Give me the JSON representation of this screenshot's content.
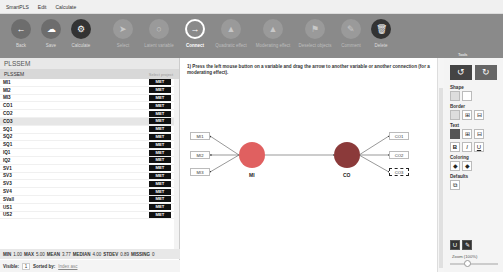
{
  "menubar": {
    "items": [
      "SmartPLS",
      "Edit",
      "Calculate"
    ]
  },
  "toolbar": {
    "buttons": [
      {
        "label": "Back",
        "icon": "←",
        "state": "normal"
      },
      {
        "label": "Save",
        "icon": "☁",
        "state": "normal"
      },
      {
        "label": "Calculate",
        "icon": "⚙",
        "state": "normal"
      },
      {
        "label": "Select",
        "icon": "➤",
        "state": "disabled"
      },
      {
        "label": "Latent variable",
        "icon": "○",
        "state": "disabled"
      },
      {
        "label": "Connect",
        "icon": "→",
        "state": "active"
      },
      {
        "label": "Quadratic effect",
        "icon": "▲",
        "state": "disabled"
      },
      {
        "label": "Moderating effect",
        "icon": "▲",
        "state": "disabled"
      },
      {
        "label": "Deselect objects",
        "icon": "⚑",
        "state": "disabled"
      },
      {
        "label": "Comment",
        "icon": "✎",
        "state": "disabled"
      },
      {
        "label": "Delete",
        "icon": "🗑",
        "state": "normal"
      }
    ],
    "tools_label": "Tools"
  },
  "left_panel": {
    "title": "PLSSEM",
    "project": "PLSSEM",
    "select_label": "Select project",
    "rows": [
      {
        "name": "MI1",
        "badge": "MET"
      },
      {
        "name": "MI2",
        "badge": "MET"
      },
      {
        "name": "MI3",
        "badge": "MET"
      },
      {
        "name": "CO1",
        "badge": "MET"
      },
      {
        "name": "CO2",
        "badge": "MET"
      },
      {
        "name": "CO3",
        "badge": "MET"
      },
      {
        "name": "SQ1",
        "badge": "MET"
      },
      {
        "name": "SQ2",
        "badge": "MET"
      },
      {
        "name": "SQ1",
        "badge": "MET"
      },
      {
        "name": "IQ1",
        "badge": "MET"
      },
      {
        "name": "IQ2",
        "badge": "MET"
      },
      {
        "name": "SV1",
        "badge": "MET"
      },
      {
        "name": "SV3",
        "badge": "MET"
      },
      {
        "name": "SV3",
        "badge": "MET"
      },
      {
        "name": "SV4",
        "badge": "MET"
      },
      {
        "name": "SVall",
        "badge": "MET"
      },
      {
        "name": "US1",
        "badge": "MET"
      },
      {
        "name": "US2",
        "badge": "MET"
      }
    ],
    "selected_index": 5,
    "stats": {
      "min_label": "MIN",
      "min": "1.00",
      "max_label": "MAX",
      "max": "5.00",
      "mean_label": "MEAN",
      "mean": "3.77",
      "median_label": "MEDIAN",
      "median": "4.00",
      "stdev_label": "STDEV",
      "stdev": "0.89",
      "missing_label": "MISSING",
      "missing": "0"
    },
    "visible_label": "Visible:",
    "visible_value": "1",
    "sorted_label": "Sorted by:",
    "sorted_value": "Index asc"
  },
  "canvas": {
    "hint": "1) Press the left mouse button on a variable and drag the arrow to another variable or another connection (for a moderating effect).",
    "indicators_left": [
      "MI1",
      "MI2",
      "MI3"
    ],
    "indicators_right": [
      "CO1",
      "CO2",
      "CO3"
    ],
    "latent_left": {
      "label": "MI",
      "color": "#e06060"
    },
    "latent_right": {
      "label": "CO",
      "color": "#8b3a3a"
    }
  },
  "right_panel": {
    "undo_icon": "↺",
    "redo_icon": "↻",
    "shape_label": "Shape",
    "border_label": "Border",
    "text_label": "Text",
    "text_buttons": [
      "B",
      "I",
      "U"
    ],
    "coloring_label": "Coloring",
    "defaults_label": "Defaults",
    "zoom_label": "Zoom (100%)"
  }
}
